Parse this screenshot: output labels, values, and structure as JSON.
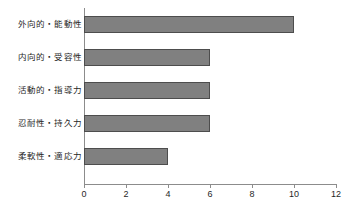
{
  "chart_data": {
    "type": "bar",
    "orientation": "horizontal",
    "title": "",
    "subtitle": "",
    "xlabel": "",
    "ylabel": "",
    "categories": [
      "外向的・能動性",
      "内向的・受容性",
      "活動的・指導力",
      "忍耐性・持久力",
      "柔軟性・適応力"
    ],
    "values": [
      10,
      6,
      6,
      6,
      4
    ],
    "xlim": [
      0,
      12
    ],
    "xticks": [
      0,
      2,
      4,
      6,
      8,
      10,
      12
    ],
    "xticklabels": [
      "0",
      "2",
      "4",
      "6",
      "8",
      "10",
      "12"
    ],
    "grid": false,
    "legend": null,
    "bar_fill_color": "#808080",
    "bar_border_color": "#4d4d4d",
    "axis_color": "#8c8c8c",
    "background_color": "#ffffff"
  }
}
